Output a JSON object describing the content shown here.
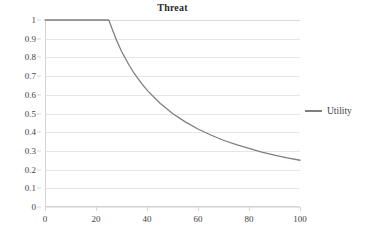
{
  "chart_data": {
    "type": "line",
    "title": "Threat",
    "xlabel": "",
    "ylabel": "",
    "xlim": [
      0,
      100
    ],
    "ylim": [
      0,
      1
    ],
    "grid": "horizontal",
    "legend_position": "right",
    "legend": [
      "Utility"
    ],
    "series": [
      {
        "name": "Utility",
        "color": "#7f7f7f",
        "description": "Constant at 1 up to x=25, then hyperbolic decay 25/x",
        "x": [
          0,
          5,
          10,
          15,
          20,
          25,
          28,
          30,
          33,
          35,
          38,
          40,
          45,
          50,
          55,
          60,
          65,
          70,
          75,
          80,
          85,
          90,
          95,
          100
        ],
        "y": [
          1,
          1,
          1,
          1,
          1,
          1,
          0.893,
          0.833,
          0.758,
          0.714,
          0.658,
          0.625,
          0.556,
          0.5,
          0.455,
          0.417,
          0.385,
          0.357,
          0.333,
          0.313,
          0.294,
          0.278,
          0.263,
          0.25
        ]
      }
    ],
    "x_ticks": [
      0,
      20,
      40,
      60,
      80,
      100
    ],
    "x_tick_labels": [
      "0",
      "20",
      "40",
      "60",
      "80",
      "100"
    ],
    "y_ticks": [
      0,
      0.1,
      0.2,
      0.3,
      0.4,
      0.5,
      0.6,
      0.7,
      0.8,
      0.9,
      1
    ],
    "y_tick_labels": [
      "0",
      "0.1",
      "0.2",
      "0.3",
      "0.4",
      "0.5",
      "0.6",
      "0.7",
      "0.8",
      "0.9",
      "1"
    ]
  },
  "colors": {
    "series_line": "#7f7f7f",
    "gridline": "#e6e6e6",
    "axis": "#d4d4d4",
    "title_text": "#2b2b2b",
    "tick_text": "#3f3f3f",
    "background": "#ffffff"
  }
}
